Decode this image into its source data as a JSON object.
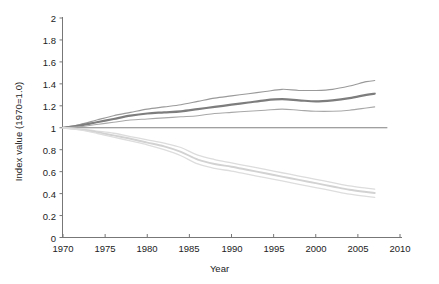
{
  "chart_data": {
    "type": "line",
    "title": "",
    "xlabel": "Year",
    "ylabel": "Index value (1970=1.0)",
    "xlim": [
      1970,
      2010
    ],
    "ylim": [
      0,
      2
    ],
    "xticks": [
      1970,
      1975,
      1980,
      1985,
      1990,
      1995,
      2000,
      2005,
      2010
    ],
    "yticks": [
      "0",
      "0.2",
      "0.4",
      "0.6",
      "0.8",
      "1",
      "1.2",
      "1.4",
      "1.6",
      "1.8",
      "2"
    ],
    "grid": false,
    "legend": "none",
    "reference_line": {
      "y": 1.0,
      "color": "#808080",
      "x_from": 1970,
      "x_to": 2008.5
    },
    "x": [
      1970,
      1972,
      1974,
      1976,
      1978,
      1980,
      1982,
      1984,
      1986,
      1988,
      1990,
      1992,
      1994,
      1996,
      1998,
      2000,
      2002,
      2004,
      2006,
      2007
    ],
    "series": [
      {
        "name": "upper-bundle-upper-bound",
        "color": "#9a9a9a",
        "width": 1.1,
        "values": [
          1.0,
          1.03,
          1.07,
          1.11,
          1.14,
          1.17,
          1.19,
          1.21,
          1.24,
          1.27,
          1.29,
          1.31,
          1.33,
          1.35,
          1.34,
          1.34,
          1.35,
          1.38,
          1.42,
          1.43
        ]
      },
      {
        "name": "upper-bundle-central",
        "color": "#7d7d7d",
        "width": 2.2,
        "values": [
          1.0,
          1.02,
          1.05,
          1.08,
          1.11,
          1.13,
          1.14,
          1.15,
          1.17,
          1.19,
          1.21,
          1.23,
          1.25,
          1.26,
          1.25,
          1.24,
          1.25,
          1.27,
          1.3,
          1.31
        ]
      },
      {
        "name": "upper-bundle-lower-bound",
        "color": "#a8a8a8",
        "width": 1.1,
        "values": [
          1.0,
          1.01,
          1.03,
          1.05,
          1.07,
          1.08,
          1.09,
          1.1,
          1.11,
          1.13,
          1.14,
          1.15,
          1.16,
          1.17,
          1.16,
          1.15,
          1.15,
          1.16,
          1.18,
          1.19
        ]
      },
      {
        "name": "lower-bundle-upper-bound",
        "color": "#dcdcdc",
        "width": 1.3,
        "values": [
          1.0,
          0.99,
          0.97,
          0.95,
          0.92,
          0.89,
          0.86,
          0.82,
          0.75,
          0.71,
          0.68,
          0.65,
          0.62,
          0.59,
          0.56,
          0.53,
          0.5,
          0.47,
          0.45,
          0.44
        ]
      },
      {
        "name": "lower-bundle-central",
        "color": "#d2d2d2",
        "width": 1.9,
        "values": [
          1.0,
          0.985,
          0.96,
          0.93,
          0.9,
          0.865,
          0.83,
          0.78,
          0.71,
          0.67,
          0.645,
          0.615,
          0.585,
          0.555,
          0.525,
          0.495,
          0.465,
          0.435,
          0.415,
          0.405
        ]
      },
      {
        "name": "lower-bundle-lower-bound",
        "color": "#dddddd",
        "width": 1.3,
        "values": [
          1.0,
          0.98,
          0.95,
          0.915,
          0.88,
          0.845,
          0.8,
          0.745,
          0.67,
          0.63,
          0.605,
          0.575,
          0.545,
          0.515,
          0.485,
          0.455,
          0.425,
          0.395,
          0.375,
          0.365
        ]
      }
    ]
  },
  "axes": {
    "y_title": "Index value (1970=1.0)",
    "x_title": "Year"
  }
}
